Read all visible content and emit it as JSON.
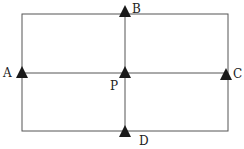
{
  "diagram": {
    "colors": {
      "line": "#555555",
      "marker": "#1a1a1a",
      "label": "#222222"
    },
    "points": [
      {
        "id": "A",
        "label": "A"
      },
      {
        "id": "B",
        "label": "B"
      },
      {
        "id": "C",
        "label": "C"
      },
      {
        "id": "D",
        "label": "D"
      },
      {
        "id": "P",
        "label": "P"
      }
    ]
  }
}
